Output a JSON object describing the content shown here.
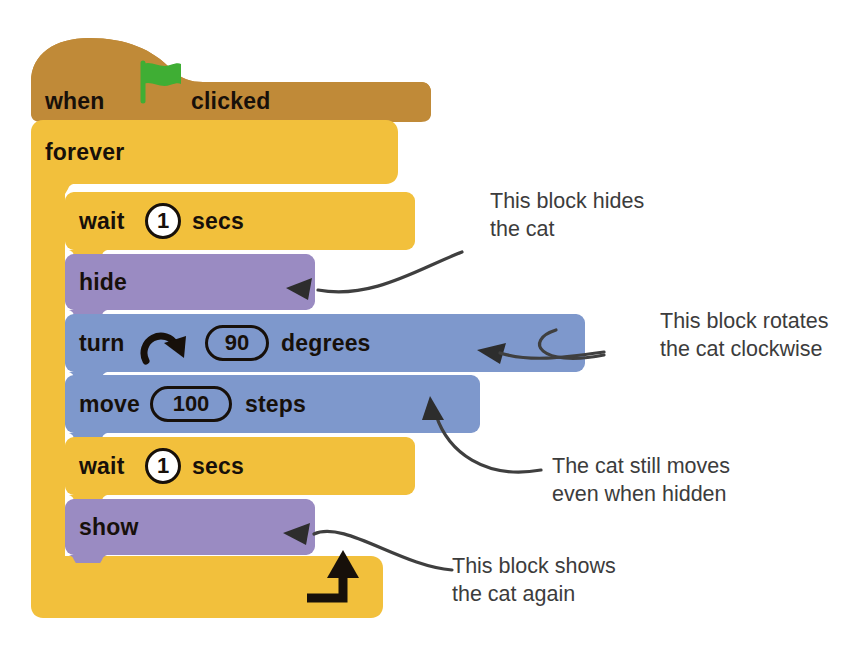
{
  "diagram": {
    "background_color": "#ffffff"
  },
  "palette": {
    "events_hat": "#c08a38",
    "control_yellow": "#f2c03c",
    "looks_purple": "#9a8bc2",
    "motion_blue": "#7e98cc",
    "text_dark": "#17100a",
    "annotation_gray": "#3c3c3c",
    "flag_green": "#3fae34",
    "input_white": "#ffffff"
  },
  "script": {
    "hat": {
      "name": "when-green-flag-clicked",
      "label_before": "when",
      "icon": "green-flag-icon",
      "label_after": "clicked",
      "color": "#c08a38"
    },
    "loop": {
      "name": "forever",
      "label": "forever",
      "color": "#f2c03c",
      "loop_arrow_icon": "loop-arrow-icon"
    },
    "blocks": [
      {
        "id": "wait-1-secs-first",
        "category": "control",
        "color": "#f2c03c",
        "label_before": "wait",
        "input_value": "1",
        "input_shape": "round",
        "label_after": "secs"
      },
      {
        "id": "hide",
        "category": "looks",
        "color": "#9a8bc2",
        "label_before": "hide",
        "input_value": "",
        "input_shape": "none",
        "label_after": ""
      },
      {
        "id": "turn-90-degrees",
        "category": "motion",
        "color": "#7e98cc",
        "label_before": "turn",
        "icon": "turn-clockwise-icon",
        "input_value": "90",
        "input_shape": "pill",
        "label_after": "degrees"
      },
      {
        "id": "move-100-steps",
        "category": "motion",
        "color": "#7e98cc",
        "label_before": "move",
        "input_value": "100",
        "input_shape": "pill",
        "label_after": "steps"
      },
      {
        "id": "wait-1-secs-second",
        "category": "control",
        "color": "#f2c03c",
        "label_before": "wait",
        "input_value": "1",
        "input_shape": "round",
        "label_after": "secs"
      },
      {
        "id": "show",
        "category": "looks",
        "color": "#9a8bc2",
        "label_before": "show",
        "input_value": "",
        "input_shape": "none",
        "label_after": ""
      }
    ]
  },
  "annotations": [
    {
      "id": "annot-hide",
      "text": "This block hides\nthe cat",
      "points_to": "hide"
    },
    {
      "id": "annot-turn",
      "text": "This block rotates\nthe cat clockwise",
      "points_to": "turn-90-degrees"
    },
    {
      "id": "annot-move",
      "text": "The cat still moves\neven when hidden",
      "points_to": "move-100-steps"
    },
    {
      "id": "annot-show",
      "text": "This block shows\nthe cat again",
      "points_to": "show"
    }
  ]
}
